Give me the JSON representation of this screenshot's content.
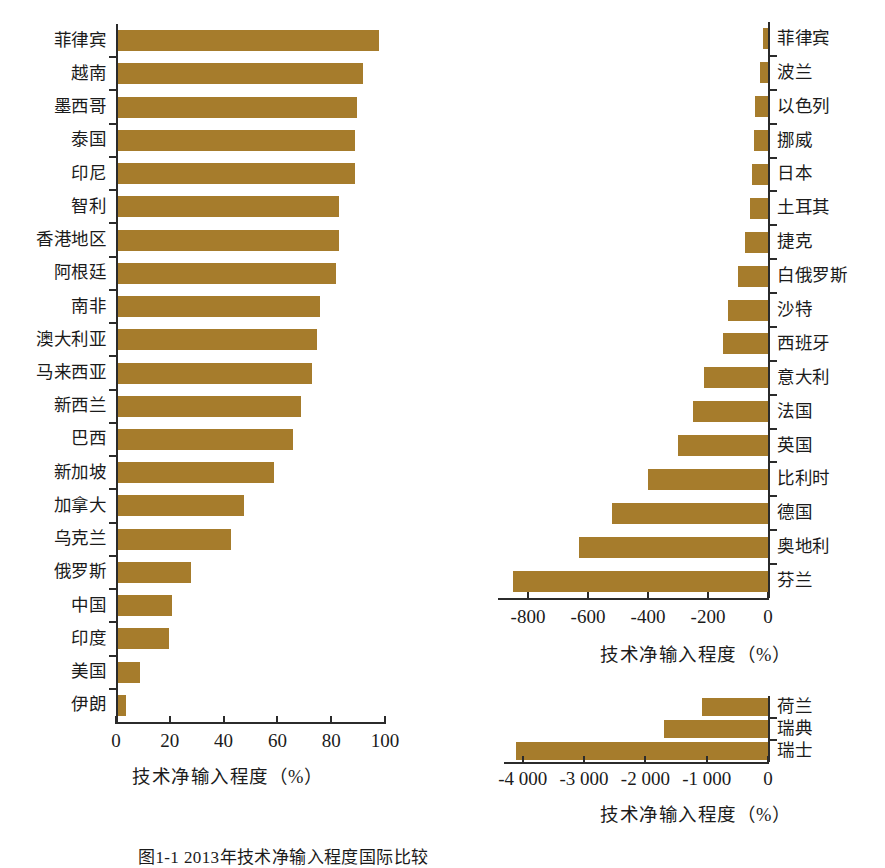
{
  "figure": {
    "caption": "图1-1  2013年技术净输入程度国际比较",
    "bar_color": "#a67c2c",
    "axis_color": "#2b2b2b"
  },
  "chart_data": [
    {
      "id": "left-panel",
      "type": "bar",
      "orientation": "horizontal",
      "title": "",
      "xlabel": "技术净输入程度（%）",
      "ylabel": "",
      "xlim": [
        0,
        100
      ],
      "xticks": [
        0,
        20,
        40,
        60,
        80,
        100
      ],
      "xticklabels": [
        "0",
        "20",
        "40",
        "60",
        "80",
        "100"
      ],
      "grid": false,
      "legend": "none",
      "label_side": "left",
      "categories": [
        "菲律宾",
        "越南",
        "墨西哥",
        "泰国",
        "印尼",
        "智利",
        "香港地区",
        "阿根廷",
        "南非",
        "澳大利亚",
        "马来西亚",
        "新西兰",
        "巴西",
        "新加坡",
        "加拿大",
        "乌克兰",
        "俄罗斯",
        "中国",
        "印度",
        "美国",
        "伊朗"
      ],
      "values": [
        97,
        91,
        89,
        88,
        88,
        82,
        82,
        81,
        75,
        74,
        72,
        68,
        65,
        58,
        47,
        42,
        27,
        20,
        19,
        8,
        3
      ]
    },
    {
      "id": "right-top-panel",
      "type": "bar",
      "orientation": "horizontal",
      "title": "",
      "xlabel": "技术净输入程度（%）",
      "ylabel": "",
      "xlim": [
        -900,
        0
      ],
      "xticks": [
        -800,
        -600,
        -400,
        -200,
        0
      ],
      "xticklabels": [
        "-800",
        "-600",
        "-400",
        "-200",
        "0"
      ],
      "grid": false,
      "legend": "none",
      "label_side": "right",
      "categories": [
        "菲律宾",
        "波兰",
        "以色列",
        "挪威",
        "日本",
        "土耳其",
        "捷克",
        "白俄罗斯",
        "沙特",
        "西班牙",
        "意大利",
        "法国",
        "英国",
        "比利时",
        "德国",
        "奥地利",
        "芬兰"
      ],
      "values": [
        -18,
        -28,
        -42,
        -48,
        -52,
        -60,
        -78,
        -100,
        -135,
        -150,
        -215,
        -250,
        -300,
        -400,
        -520,
        -630,
        -850
      ]
    },
    {
      "id": "right-bottom-panel",
      "type": "bar",
      "orientation": "horizontal",
      "title": "",
      "xlabel": "技术净输入程度（%）",
      "ylabel": "",
      "xlim": [
        -4300,
        0
      ],
      "xticks": [
        -4000,
        -3000,
        -2000,
        -1000,
        0
      ],
      "xticklabels": [
        "-4 000",
        "-3 000",
        "-2 000",
        "-1 000",
        "0"
      ],
      "grid": false,
      "legend": "none",
      "label_side": "right",
      "categories": [
        "荷兰",
        "瑞典",
        "瑞士"
      ],
      "values": [
        -1080,
        -1690,
        -4110
      ]
    }
  ]
}
